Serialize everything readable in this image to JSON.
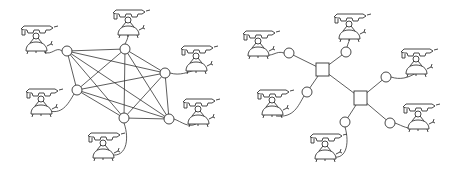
{
  "diagrams": [
    {
      "name": "fully-connected-mesh",
      "nodes": [
        {
          "id": "a",
          "x": 67,
          "y": 51,
          "phone": {
            "x": 20,
            "y": 25
          },
          "cord": "M 62 51 C 56 46, 52 56, 44 52"
        },
        {
          "id": "b",
          "x": 125,
          "y": 49,
          "phone": {
            "x": 112,
            "y": 9
          },
          "cord": "M 125 44 C 127 40, 128 38, 128 35"
        },
        {
          "id": "c",
          "x": 165,
          "y": 73,
          "phone": {
            "x": 180,
            "y": 45
          },
          "cord": "M 170 73 C 180 76, 188 72, 195 70"
        },
        {
          "id": "d",
          "x": 77,
          "y": 90,
          "phone": {
            "x": 25,
            "y": 88
          },
          "cord": "M 74 94 C 68 104, 62 116, 46 110"
        },
        {
          "id": "e",
          "x": 124,
          "y": 118,
          "phone": {
            "x": 87,
            "y": 132
          },
          "cord": "M 124 123 C 130 140, 126 160, 108 154"
        },
        {
          "id": "f",
          "x": 169,
          "y": 119,
          "phone": {
            "x": 182,
            "y": 98
          },
          "cord": "M 174 119 C 182 122, 188 128, 196 124"
        }
      ],
      "edges": [
        [
          "a",
          "b"
        ],
        [
          "a",
          "c"
        ],
        [
          "a",
          "d"
        ],
        [
          "a",
          "e"
        ],
        [
          "a",
          "f"
        ],
        [
          "b",
          "c"
        ],
        [
          "b",
          "d"
        ],
        [
          "b",
          "e"
        ],
        [
          "b",
          "f"
        ],
        [
          "c",
          "d"
        ],
        [
          "c",
          "e"
        ],
        [
          "c",
          "f"
        ],
        [
          "d",
          "e"
        ],
        [
          "d",
          "f"
        ],
        [
          "e",
          "f"
        ]
      ]
    },
    {
      "name": "star-switched-network",
      "switches": [
        {
          "id": "s1",
          "x": 316,
          "y": 63,
          "w": 13,
          "h": 13
        },
        {
          "id": "s2",
          "x": 354,
          "y": 91,
          "w": 13,
          "h": 14
        }
      ],
      "nodes": [
        {
          "id": "a",
          "x": 289,
          "y": 53,
          "phone": {
            "x": 242,
            "y": 30
          },
          "cord": "M 284 53 C 276 50, 272 58, 264 54"
        },
        {
          "id": "b",
          "x": 346,
          "y": 52,
          "phone": {
            "x": 333,
            "y": 13
          },
          "cord": "M 347 47 C 348 43, 350 40, 350 37"
        },
        {
          "id": "c",
          "x": 386,
          "y": 77,
          "phone": {
            "x": 400,
            "y": 48
          },
          "cord": "M 391 77 C 400 80, 408 78, 416 73"
        },
        {
          "id": "d",
          "x": 307,
          "y": 92,
          "phone": {
            "x": 256,
            "y": 89
          },
          "cord": "M 304 96 C 298 106, 294 118, 276 116"
        },
        {
          "id": "e",
          "x": 345,
          "y": 122,
          "phone": {
            "x": 309,
            "y": 133
          },
          "cord": "M 345 127 C 350 144, 346 162, 330 156"
        },
        {
          "id": "f",
          "x": 390,
          "y": 123,
          "phone": {
            "x": 402,
            "y": 103
          },
          "cord": "M 395 123 C 403 126, 408 130, 416 127"
        }
      ],
      "links": [
        {
          "from": "a",
          "to": "s1"
        },
        {
          "from": "b",
          "to": "s1"
        },
        {
          "from": "d",
          "to": "s1"
        },
        {
          "from": "s1",
          "to": "s2"
        },
        {
          "from": "c",
          "to": "s2"
        },
        {
          "from": "e",
          "to": "s2"
        },
        {
          "from": "f",
          "to": "s2"
        }
      ]
    }
  ],
  "style": {
    "stroke": "#333333",
    "background": "#ffffff"
  }
}
